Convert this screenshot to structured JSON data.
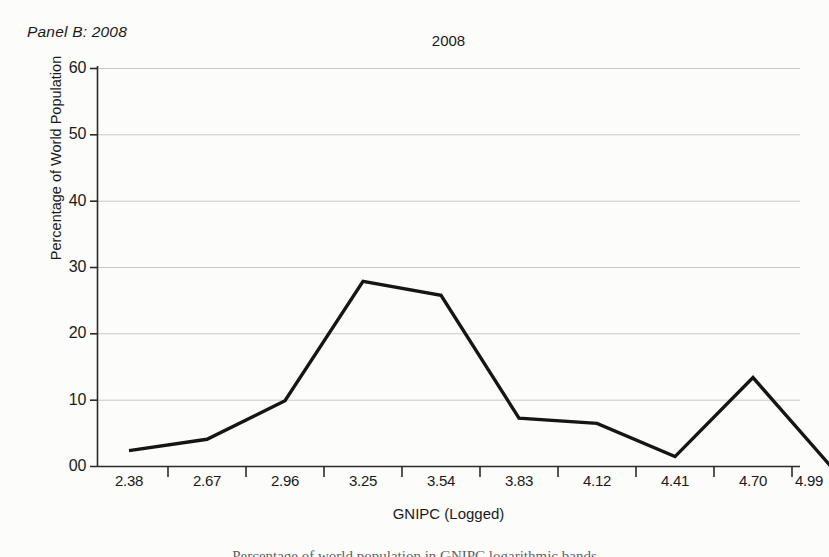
{
  "figure": {
    "panel_label": "Panel B: 2008",
    "caption_partial": "Percentage of world population in GNIPC logarithmic bands"
  },
  "chart_data": {
    "type": "line",
    "title": "2008",
    "xlabel": "GNIPC (Logged)",
    "ylabel": "Percentage of World Population",
    "x": [
      "2.38",
      "2.67",
      "2.96",
      "3.25",
      "3.54",
      "3.83",
      "4.12",
      "4.41",
      "4.70",
      "4.99"
    ],
    "values": [
      2.4,
      4.1,
      9.9,
      27.9,
      25.8,
      7.3,
      6.5,
      1.5,
      13.4,
      0.0
    ],
    "categories": [
      "2.38",
      "2.67",
      "2.96",
      "3.25",
      "3.54",
      "3.83",
      "4.12",
      "4.41",
      "4.70",
      "4.99"
    ],
    "ytick_labels": [
      "60",
      "50",
      "40",
      "30",
      "20",
      "10",
      "00"
    ],
    "ytick_values": [
      60,
      50,
      40,
      30,
      20,
      10,
      0
    ],
    "ylim": [
      0,
      60
    ],
    "grid": "horizontal",
    "legend": "none",
    "line_color": "#151515",
    "grid_color": "#c9c9c9",
    "axis_color": "#2a2a2a",
    "background": "#fcfcfb"
  }
}
